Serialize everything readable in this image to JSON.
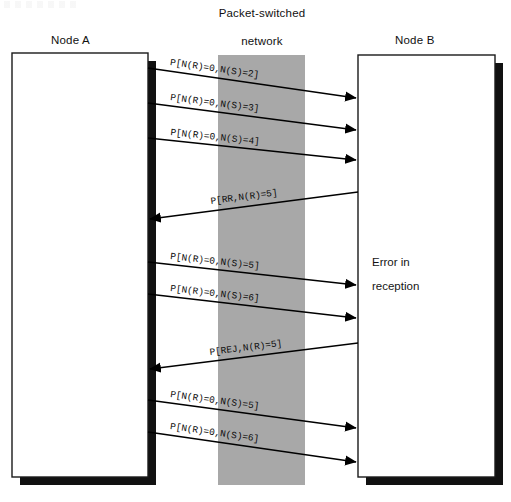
{
  "diagram": {
    "title_network": "Packet-switched\nnetwork",
    "network_line1": "Packet-switched",
    "network_line2": "network",
    "nodes": [
      {
        "id": "node-a",
        "label": "Node A"
      },
      {
        "id": "node-b",
        "label": "Node B"
      }
    ],
    "node_b_annotation_line1": "Error in",
    "node_b_annotation_line2": "reception",
    "colors": {
      "network_band": "#a8a8a8",
      "box_border": "#1a1a1a",
      "shadow": "#111111",
      "line": "#000000",
      "text": "#111111",
      "background": "#ffffff"
    },
    "messages": [
      {
        "id": "msg-1",
        "label": "P[N(R)=0,N(S)=2]",
        "direction": "a-to-b"
      },
      {
        "id": "msg-2",
        "label": "P[N(R)=0,N(S)=3]",
        "direction": "a-to-b"
      },
      {
        "id": "msg-3",
        "label": "P[N(R)=0,N(S)=4]",
        "direction": "a-to-b"
      },
      {
        "id": "msg-4",
        "label": "P[RR,N(R)=5]",
        "direction": "b-to-a"
      },
      {
        "id": "msg-5",
        "label": "P[N(R)=0,N(S)=5]",
        "direction": "a-to-b"
      },
      {
        "id": "msg-6",
        "label": "P[N(R)=0,N(S)=6]",
        "direction": "a-to-b"
      },
      {
        "id": "msg-7",
        "label": "P[REJ,N(R)=5]",
        "direction": "b-to-a"
      },
      {
        "id": "msg-8",
        "label": "P[N(R)=0,N(S)=5]",
        "direction": "a-to-b"
      },
      {
        "id": "msg-9",
        "label": "P[N(R)=0,N(S)=6]",
        "direction": "a-to-b"
      }
    ]
  }
}
